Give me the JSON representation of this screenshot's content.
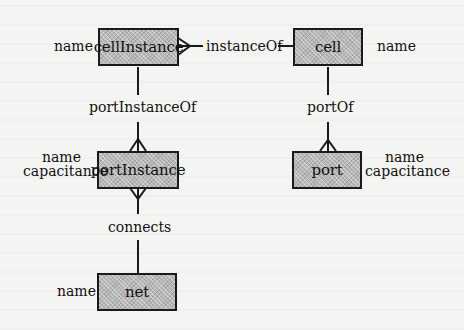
{
  "diagram": {
    "type": "entity-relationship",
    "entities": [
      {
        "id": "cellInstance",
        "label": "cellInstance",
        "attributes": [
          "name"
        ]
      },
      {
        "id": "cell",
        "label": "cell",
        "attributes": [
          "name"
        ]
      },
      {
        "id": "portInstance",
        "label": "portInstance",
        "attributes": [
          "name",
          "capacitance"
        ]
      },
      {
        "id": "port",
        "label": "port",
        "attributes": [
          "name",
          "capacitance"
        ]
      },
      {
        "id": "net",
        "label": "net",
        "attributes": [
          "name"
        ]
      }
    ],
    "relationships": [
      {
        "label": "instanceOf",
        "from": "cellInstance",
        "to": "cell",
        "from_cardinality": "many",
        "to_cardinality": "one"
      },
      {
        "label": "portInstanceOf",
        "from": "portInstance",
        "to": "cellInstance",
        "from_cardinality": "many",
        "to_cardinality": "one"
      },
      {
        "label": "portOf",
        "from": "port",
        "to": "cell",
        "from_cardinality": "many",
        "to_cardinality": "one"
      },
      {
        "label": "connects",
        "from": "portInstance",
        "to": "net",
        "from_cardinality": "many",
        "to_cardinality": "one"
      }
    ]
  },
  "labels": {
    "cellInstance_name": "name",
    "cell_name": "name",
    "portInstance_name": "name",
    "portInstance_capacitance": "capacitance",
    "port_name": "name",
    "port_capacitance": "capacitance",
    "net_name": "name",
    "rel_instanceOf": "instanceOf",
    "rel_portInstanceOf": "portInstanceOf",
    "rel_portOf": "portOf",
    "rel_connects": "connects"
  }
}
